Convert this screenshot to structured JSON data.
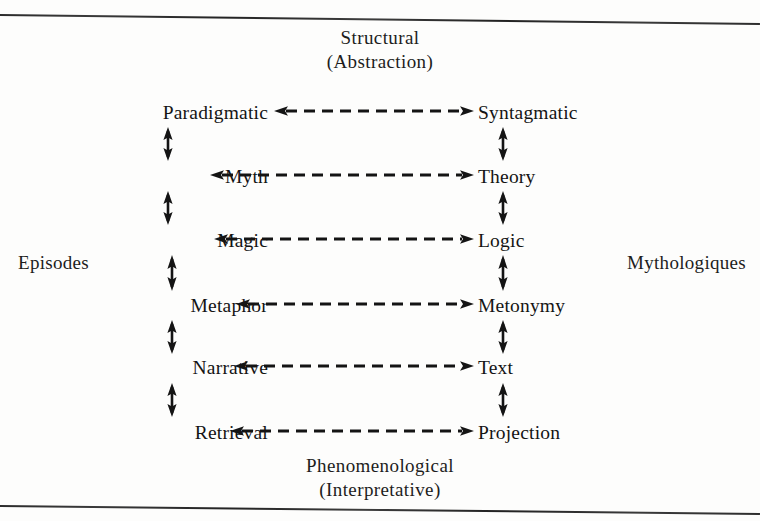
{
  "diagram": {
    "captions": {
      "top_line1": "Structural",
      "top_line2": "(Abstraction)",
      "bottom_line1": "Phenomenological",
      "bottom_line2": "(Interpretative)",
      "left": "Episodes",
      "right": "Mythologiques"
    },
    "rows": [
      {
        "left": "Paradigmatic",
        "right": "Syntagmatic"
      },
      {
        "left": "Myth",
        "right": "Theory"
      },
      {
        "left": "Magic",
        "right": "Logic"
      },
      {
        "left": "Metaphor",
        "right": "Metonymy"
      },
      {
        "left": "Narrative",
        "right": "Text"
      },
      {
        "left": "Retrieval",
        "right": "Projection"
      }
    ],
    "connectors": {
      "horizontal": "double-headed-dashed-arrow",
      "vertical": "double-headed-arrow"
    },
    "colors": {
      "ink": "#141414",
      "paper": "#fdfdfc",
      "rule": "#2c2c2c"
    }
  }
}
